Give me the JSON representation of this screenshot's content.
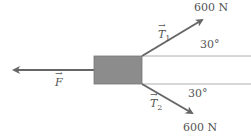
{
  "diagram": {
    "forces": [
      {
        "name": "F",
        "label": "F",
        "direction": "left"
      },
      {
        "name": "T1",
        "label": "T",
        "subscript": "1",
        "magnitude": "600 N",
        "angle": "30°"
      },
      {
        "name": "T2",
        "label": "T",
        "subscript": "2",
        "magnitude": "600 N",
        "angle": "30°"
      }
    ],
    "colors": {
      "box": "#8c8c8c",
      "arrow": "#666666",
      "line": "#999999"
    }
  }
}
